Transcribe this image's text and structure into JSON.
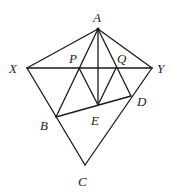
{
  "figure": {
    "type": "geometry",
    "stroke_color": "#1a1a1a",
    "label_color": "#222222",
    "points": {
      "A": {
        "x": 98,
        "y": 29
      },
      "X": {
        "x": 27,
        "y": 68
      },
      "Y": {
        "x": 152,
        "y": 68
      },
      "P": {
        "x": 79,
        "y": 68
      },
      "Q": {
        "x": 116,
        "y": 68
      },
      "E": {
        "x": 98,
        "y": 105
      },
      "B": {
        "x": 56,
        "y": 117
      },
      "D": {
        "x": 131,
        "y": 96
      },
      "C": {
        "x": 85,
        "y": 165
      }
    },
    "segments": [
      [
        "A",
        "X"
      ],
      [
        "A",
        "Y"
      ],
      [
        "X",
        "Y"
      ],
      [
        "A",
        "B"
      ],
      [
        "A",
        "D"
      ],
      [
        "A",
        "E"
      ],
      [
        "X",
        "C"
      ],
      [
        "Y",
        "C"
      ],
      [
        "P",
        "E"
      ],
      [
        "Q",
        "E"
      ],
      [
        "B",
        "D"
      ]
    ],
    "labels": [
      {
        "text": "A",
        "x": 93,
        "y": 22
      },
      {
        "text": "X",
        "x": 9,
        "y": 73
      },
      {
        "text": "Y",
        "x": 157,
        "y": 73
      },
      {
        "text": "P",
        "x": 69,
        "y": 63
      },
      {
        "text": "Q",
        "x": 117,
        "y": 63
      },
      {
        "text": "E",
        "x": 91,
        "y": 125
      },
      {
        "text": "B",
        "x": 40,
        "y": 130
      },
      {
        "text": "D",
        "x": 137,
        "y": 106
      },
      {
        "text": "C",
        "x": 78,
        "y": 186
      }
    ]
  }
}
